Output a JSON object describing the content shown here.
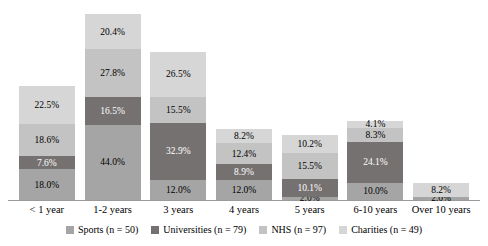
{
  "chart_data": {
    "type": "bar",
    "subtype": "stacked-bar",
    "title": "",
    "xlabel": "",
    "ylabel": "",
    "grid": false,
    "legend_position": "bottom",
    "axis_visible": "x-baseline-only",
    "ylim": [
      0,
      110
    ],
    "categories": [
      "< 1 year",
      "1-2 years",
      "3 years",
      "4 years",
      "5 years",
      "6-10 years",
      "Over 10 years"
    ],
    "series": [
      {
        "name": "Sports (n = 50)",
        "short_name": "Sports",
        "n": 50,
        "color": "#a5a5a5",
        "values": [
          18.0,
          44.0,
          12.0,
          12.0,
          2.0,
          10.0,
          2.0
        ],
        "labels": [
          "18.0%",
          "44.0%",
          "12.0%",
          "12.0%",
          "2.0%",
          "10.0%",
          "2.0%"
        ]
      },
      {
        "name": "Universities (n = 79)",
        "short_name": "Universities",
        "n": 79,
        "color": "#767171",
        "values": [
          7.6,
          16.5,
          32.9,
          8.9,
          10.1,
          24.1,
          0.0
        ],
        "labels": [
          "7.6%",
          "16.5%",
          "32.9%",
          "8.9%",
          "10.1%",
          "24.1%",
          ""
        ]
      },
      {
        "name": "NHS (n = 97)",
        "short_name": "NHS",
        "n": 97,
        "color": "#c3c3c3",
        "values": [
          18.6,
          27.8,
          15.5,
          12.4,
          15.5,
          8.3,
          0.0
        ],
        "labels": [
          "18.6%",
          "27.8%",
          "15.5%",
          "12.4%",
          "15.5%",
          "8.3%",
          ""
        ]
      },
      {
        "name": "Charities (n = 49)",
        "short_name": "Charities",
        "n": 49,
        "color": "#d6d6d6",
        "values": [
          22.5,
          20.4,
          26.5,
          8.2,
          10.2,
          4.1,
          8.2
        ],
        "labels": [
          "22.5%",
          "20.4%",
          "26.5%",
          "8.2%",
          "10.2%",
          "4.1%",
          "8.2%"
        ]
      }
    ],
    "totals": [
      66.7,
      108.7,
      86.9,
      41.5,
      37.8,
      46.5,
      10.2
    ]
  },
  "legend": {
    "items": [
      {
        "label": "Sports (n = 50)",
        "color": "#a5a5a5"
      },
      {
        "label": "Universities (n = 79)",
        "color": "#767171"
      },
      {
        "label": "NHS (n = 97)",
        "color": "#c3c3c3"
      },
      {
        "label": "Charities (n = 49)",
        "color": "#d6d6d6"
      }
    ]
  },
  "axis": {
    "baseline_color": "#9a9a9a"
  }
}
